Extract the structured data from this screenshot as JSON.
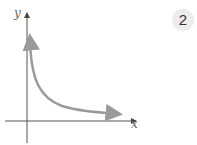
{
  "figure": {
    "badge_number": "2",
    "x_axis_label": "x",
    "y_axis_label": "y",
    "curve": "decreasing hyperbola-like curve approaching both axes asymptotically (y = k/x, first quadrant)",
    "colors": {
      "axis": "#555555",
      "curve": "#9a9a9a",
      "badge_bg": "#ececec"
    }
  }
}
